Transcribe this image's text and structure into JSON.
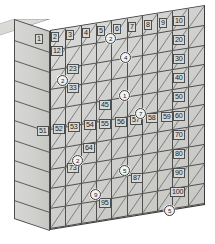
{
  "figure": {
    "rows": 10,
    "columns": 10,
    "colors": {
      "face_light": "#d9d9d7",
      "face_mid": "#d0d0ce",
      "face_dark": "#c8c8c5",
      "line": "#4f4f4f",
      "outline": "#3c3c3c",
      "label_text": "#1a1a1a",
      "label_fill": "#d8d8d5",
      "circle_fill": "#f2f2f0"
    }
  },
  "labels": [
    {
      "text": "1",
      "x": 35,
      "y": 34,
      "circled": false
    },
    {
      "text": "2",
      "x": 51,
      "y": 32,
      "circled": false
    },
    {
      "text": "3",
      "x": 66,
      "y": 30,
      "circled": false
    },
    {
      "text": "4",
      "x": 82,
      "y": 28,
      "circled": false
    },
    {
      "text": "5",
      "x": 97,
      "y": 26,
      "circled": false
    },
    {
      "text": "6",
      "x": 113,
      "y": 24,
      "circled": false
    },
    {
      "text": "7",
      "x": 128,
      "y": 22,
      "circled": false
    },
    {
      "text": "8",
      "x": 144,
      "y": 20,
      "circled": false
    },
    {
      "text": "9",
      "x": 159,
      "y": 18,
      "circled": false
    },
    {
      "text": "10",
      "x": 173,
      "y": 16,
      "circled": false
    },
    {
      "text": "20",
      "x": 173,
      "y": 35,
      "circled": false
    },
    {
      "text": "30",
      "x": 173,
      "y": 54,
      "circled": false
    },
    {
      "text": "40",
      "x": 173,
      "y": 73,
      "circled": false
    },
    {
      "text": "50",
      "x": 173,
      "y": 92,
      "circled": false
    },
    {
      "text": "60",
      "x": 173,
      "y": 111,
      "circled": false
    },
    {
      "text": "70",
      "x": 173,
      "y": 130,
      "circled": false
    },
    {
      "text": "80",
      "x": 173,
      "y": 149,
      "circled": false
    },
    {
      "text": "90",
      "x": 173,
      "y": 168,
      "circled": false
    },
    {
      "text": "100",
      "x": 170,
      "y": 187,
      "circled": false
    },
    {
      "text": "51",
      "x": 37,
      "y": 126,
      "circled": false
    },
    {
      "text": "52",
      "x": 53,
      "y": 124,
      "circled": false
    },
    {
      "text": "53",
      "x": 68,
      "y": 122,
      "circled": false
    },
    {
      "text": "54",
      "x": 84,
      "y": 120,
      "circled": false
    },
    {
      "text": "55",
      "x": 99,
      "y": 119,
      "circled": false
    },
    {
      "text": "56",
      "x": 115,
      "y": 117,
      "circled": false
    },
    {
      "text": "57",
      "x": 130,
      "y": 115,
      "circled": false
    },
    {
      "text": "58",
      "x": 146,
      "y": 113,
      "circled": false
    },
    {
      "text": "59",
      "x": 161,
      "y": 112,
      "circled": false
    },
    {
      "text": "12",
      "x": 51,
      "y": 46,
      "circled": false
    },
    {
      "text": "23",
      "x": 67,
      "y": 64,
      "circled": false
    },
    {
      "text": "33",
      "x": 67,
      "y": 83,
      "circled": false
    },
    {
      "text": "45",
      "x": 99,
      "y": 100,
      "circled": false
    },
    {
      "text": "64",
      "x": 83,
      "y": 143,
      "circled": false
    },
    {
      "text": "73",
      "x": 67,
      "y": 163,
      "circled": false
    },
    {
      "text": "87",
      "x": 131,
      "y": 173,
      "circled": false
    },
    {
      "text": "95",
      "x": 99,
      "y": 198,
      "circled": false
    },
    {
      "text": "2",
      "x": 105,
      "y": 33,
      "circled": true
    },
    {
      "text": "4",
      "x": 120,
      "y": 52,
      "circled": true
    },
    {
      "text": "2",
      "x": 57,
      "y": 75,
      "circled": true
    },
    {
      "text": "1",
      "x": 119,
      "y": 90,
      "circled": true
    },
    {
      "text": "7",
      "x": 135,
      "y": 108,
      "circled": true
    },
    {
      "text": "2",
      "x": 72,
      "y": 155,
      "circled": true
    },
    {
      "text": "5",
      "x": 119,
      "y": 165,
      "circled": true
    },
    {
      "text": "9",
      "x": 90,
      "y": 189,
      "circled": true
    },
    {
      "text": "5",
      "x": 164,
      "y": 205,
      "circled": true
    }
  ]
}
